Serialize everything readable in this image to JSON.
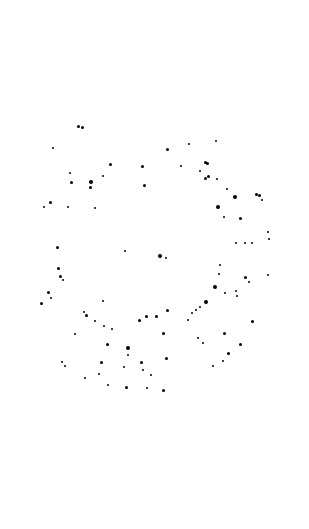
{
  "image": {
    "background": "#ffffff",
    "dot_color": "#000000",
    "description": "Scattered black dots forming a rough ring on white background",
    "dots": [
      [
        78,
        126,
        3
      ],
      [
        82,
        127,
        3
      ],
      [
        53,
        148,
        2
      ],
      [
        167,
        149,
        3
      ],
      [
        189,
        144,
        2
      ],
      [
        216,
        141,
        2
      ],
      [
        110,
        164,
        3
      ],
      [
        142,
        166,
        3
      ],
      [
        181,
        166,
        2
      ],
      [
        205,
        162,
        3
      ],
      [
        207,
        163,
        3
      ],
      [
        200,
        171,
        2
      ],
      [
        70,
        173,
        2
      ],
      [
        71,
        182,
        3
      ],
      [
        91,
        182,
        4
      ],
      [
        90,
        187,
        3
      ],
      [
        103,
        176,
        2
      ],
      [
        144,
        185,
        3
      ],
      [
        205,
        178,
        3
      ],
      [
        208,
        176,
        3
      ],
      [
        217,
        179,
        2
      ],
      [
        227,
        189,
        2
      ],
      [
        235,
        197,
        4
      ],
      [
        256,
        194,
        3
      ],
      [
        259,
        195,
        3
      ],
      [
        262,
        200,
        2
      ],
      [
        50,
        202,
        3
      ],
      [
        44,
        207,
        2
      ],
      [
        68,
        207,
        2
      ],
      [
        95,
        208,
        2
      ],
      [
        218,
        207,
        4
      ],
      [
        224,
        217,
        2
      ],
      [
        240,
        218,
        3
      ],
      [
        268,
        232,
        2
      ],
      [
        269,
        239,
        2
      ],
      [
        57,
        247,
        3
      ],
      [
        125,
        251,
        2
      ],
      [
        160,
        256,
        4
      ],
      [
        166,
        258,
        2
      ],
      [
        236,
        243,
        2
      ],
      [
        245,
        243,
        2
      ],
      [
        252,
        243,
        2
      ],
      [
        58,
        268,
        3
      ],
      [
        60,
        276,
        3
      ],
      [
        63,
        280,
        2
      ],
      [
        220,
        265,
        2
      ],
      [
        219,
        274,
        2
      ],
      [
        245,
        277,
        3
      ],
      [
        249,
        282,
        2
      ],
      [
        268,
        275,
        2
      ],
      [
        48,
        292,
        3
      ],
      [
        51,
        298,
        2
      ],
      [
        41,
        303,
        3
      ],
      [
        103,
        301,
        2
      ],
      [
        215,
        287,
        4
      ],
      [
        225,
        293,
        2
      ],
      [
        237,
        296,
        2
      ],
      [
        236,
        291,
        2
      ],
      [
        206,
        302,
        4
      ],
      [
        84,
        312,
        2
      ],
      [
        86,
        315,
        3
      ],
      [
        95,
        321,
        2
      ],
      [
        104,
        326,
        2
      ],
      [
        112,
        329,
        2
      ],
      [
        139,
        320,
        3
      ],
      [
        146,
        316,
        3
      ],
      [
        156,
        316,
        3
      ],
      [
        167,
        310,
        3
      ],
      [
        188,
        320,
        2
      ],
      [
        192,
        313,
        2
      ],
      [
        196,
        310,
        2
      ],
      [
        200,
        307,
        2
      ],
      [
        252,
        321,
        3
      ],
      [
        224,
        333,
        3
      ],
      [
        75,
        334,
        2
      ],
      [
        107,
        344,
        3
      ],
      [
        128,
        348,
        4
      ],
      [
        128,
        355,
        2
      ],
      [
        163,
        333,
        3
      ],
      [
        198,
        338,
        2
      ],
      [
        203,
        343,
        2
      ],
      [
        240,
        344,
        3
      ],
      [
        62,
        362,
        2
      ],
      [
        65,
        366,
        2
      ],
      [
        101,
        362,
        3
      ],
      [
        124,
        367,
        2
      ],
      [
        141,
        362,
        3
      ],
      [
        143,
        370,
        2
      ],
      [
        166,
        358,
        3
      ],
      [
        228,
        353,
        3
      ],
      [
        223,
        361,
        2
      ],
      [
        213,
        366,
        2
      ],
      [
        85,
        378,
        2
      ],
      [
        99,
        374,
        2
      ],
      [
        108,
        385,
        2
      ],
      [
        126,
        387,
        3
      ],
      [
        147,
        388,
        2
      ],
      [
        163,
        390,
        3
      ],
      [
        151,
        375,
        2
      ]
    ]
  }
}
